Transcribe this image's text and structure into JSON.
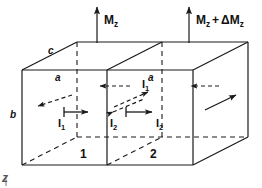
{
  "figure": {
    "type": "physics-schematic",
    "stroke_color": "#1a1a1a",
    "background_color": "#ffffff"
  },
  "magnetization": {
    "left": {
      "symbol": "M",
      "subscript": "z",
      "full": "M_z"
    },
    "right": {
      "symbol": "M",
      "subscript": "z",
      "plus": "+",
      "delta": "ΔM",
      "delta_subscript": "z",
      "full": "M_z + ΔM_z"
    }
  },
  "dimensions": [
    {
      "id": "c",
      "label": "c",
      "edge": "top-depth"
    },
    {
      "id": "a",
      "label": "a",
      "edge": "top-width-left"
    },
    {
      "id": "a2",
      "label": "a",
      "edge": "top-width-right"
    },
    {
      "id": "b",
      "label": "b",
      "edge": "left-height"
    }
  ],
  "currents": [
    {
      "id": "I1-front",
      "symbol": "I",
      "subscript": "1",
      "full": "I_1"
    },
    {
      "id": "I1-mid",
      "symbol": "I",
      "subscript": "1",
      "full": "I_1"
    },
    {
      "id": "I2-left",
      "symbol": "I",
      "subscript": "2",
      "full": "I_2"
    },
    {
      "id": "I2-right",
      "symbol": "I",
      "subscript": "2",
      "full": "I_2"
    }
  ],
  "cells": [
    {
      "id": "cell-1",
      "label": "1"
    },
    {
      "id": "cell-2",
      "label": "2"
    }
  ],
  "corner_mark": {
    "label": "z"
  },
  "icons": {
    "arrow_up": "arrow-up-icon",
    "arrow_right": "arrow-right-icon",
    "arrow_left": "arrow-left-icon",
    "arrow_diag": "arrow-diagonal-icon"
  }
}
